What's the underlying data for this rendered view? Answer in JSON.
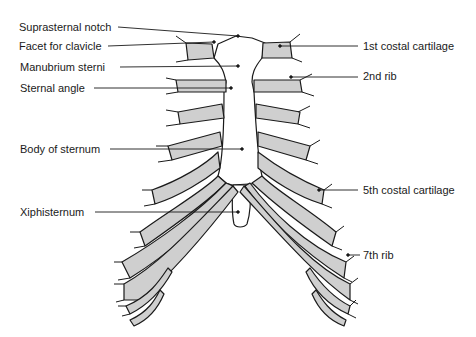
{
  "diagram": {
    "colors": {
      "cartilage_fill": "#cfcfcf",
      "outline": "#1a1a1a",
      "background": "#ffffff"
    },
    "labels_left": [
      {
        "text": "Suprasternal notch",
        "x": 19,
        "y": 21
      },
      {
        "text": "Facet for clavicle",
        "x": 19,
        "y": 40
      },
      {
        "text": "Manubrium sterni",
        "x": 20,
        "y": 61
      },
      {
        "text": "Sternal angle",
        "x": 20,
        "y": 82
      },
      {
        "text": "Body of sternum",
        "x": 20,
        "y": 143
      },
      {
        "text": "Xiphisternum",
        "x": 20,
        "y": 206
      }
    ],
    "labels_right": [
      {
        "text": "1st costal cartilage",
        "x": 363,
        "y": 40
      },
      {
        "text": "2nd rib",
        "x": 363,
        "y": 70
      },
      {
        "text": "5th costal cartilage",
        "x": 363,
        "y": 184
      },
      {
        "text": "7th rib",
        "x": 363,
        "y": 249
      }
    ]
  }
}
